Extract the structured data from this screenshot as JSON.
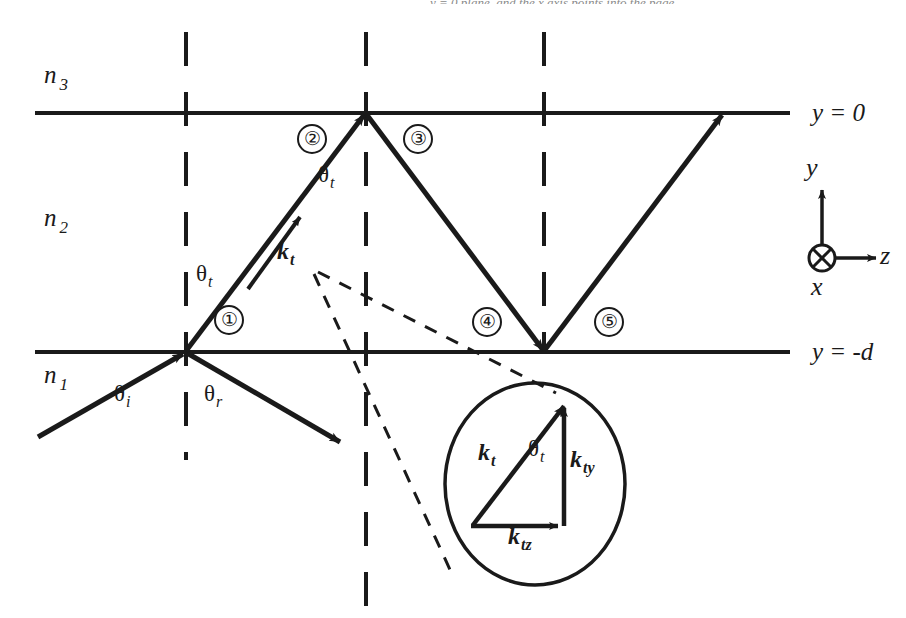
{
  "figure": {
    "title_cut_off": "y = 0 plane, and the x axis points into the page",
    "media_labels": [
      {
        "name": "n3",
        "base": "n",
        "sub": "3",
        "x": 44,
        "y": 62
      },
      {
        "name": "n2",
        "base": "n",
        "sub": "2",
        "x": 44,
        "y": 205
      },
      {
        "name": "n1",
        "base": "n",
        "sub": "1",
        "x": 44,
        "y": 362
      }
    ],
    "boundary_labels": [
      {
        "name": "y-equals-0",
        "text": "y = 0",
        "x": 812,
        "y": 100
      },
      {
        "name": "y-equals-minus-d",
        "text": "y = -d",
        "x": 812,
        "y": 339
      }
    ],
    "angle_labels": [
      {
        "name": "theta-t-lower",
        "base": "θ",
        "sub": "t",
        "x": 196,
        "y": 262
      },
      {
        "name": "theta-t-upper",
        "base": "θ",
        "sub": "t",
        "x": 318,
        "y": 163
      },
      {
        "name": "theta-i",
        "base": "θ",
        "sub": "i",
        "x": 114,
        "y": 382
      },
      {
        "name": "theta-r",
        "base": "θ",
        "sub": "r",
        "x": 204,
        "y": 382
      }
    ],
    "k_labels": [
      {
        "name": "k-t-main",
        "base": "k",
        "sub": "t",
        "x": 277,
        "y": 239
      },
      {
        "name": "k-t-inset",
        "base": "k",
        "sub": "t",
        "x": 478,
        "y": 440
      },
      {
        "name": "k-ty-inset",
        "base": "k",
        "sub": "ty",
        "x": 570,
        "y": 447
      },
      {
        "name": "k-tz-inset",
        "base": "k",
        "sub": "tz",
        "x": 508,
        "y": 524
      }
    ],
    "inset_angle": {
      "name": "theta-t-inset",
      "base": "θ",
      "sub": "t",
      "x": 528,
      "y": 437
    },
    "ray_numbers": [
      {
        "name": "ray-number-1",
        "text": "①",
        "x": 214,
        "y": 305
      },
      {
        "name": "ray-number-2",
        "text": "②",
        "x": 297,
        "y": 124
      },
      {
        "name": "ray-number-3",
        "text": "③",
        "x": 403,
        "y": 124
      },
      {
        "name": "ray-number-4",
        "text": "④",
        "x": 472,
        "y": 307
      },
      {
        "name": "ray-number-5",
        "text": "⑤",
        "x": 594,
        "y": 307
      }
    ],
    "axis_triad": {
      "y_label": "y",
      "z_label": "z",
      "x_label": "x",
      "origin_x": 822,
      "origin_y": 258
    },
    "colors": {
      "ink": "#1a1a1a",
      "background": "#ffffff"
    }
  }
}
